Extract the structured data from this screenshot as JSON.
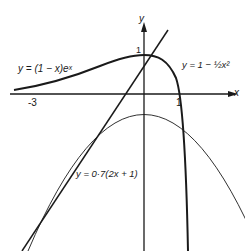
{
  "figure": {
    "axes": {
      "x_label": "x",
      "y_label": "y"
    },
    "ticks": {
      "x_neg3": "-3",
      "x_1": "1",
      "y_1": "1"
    },
    "curves": [
      {
        "name": "exp-curve",
        "label": "y = (1 − x)eˣ",
        "style": "thick"
      },
      {
        "name": "parabola",
        "label": "y = 1 − ½x²",
        "style": "thin"
      },
      {
        "name": "line",
        "label": "y = 0·7(2x + 1)",
        "style": "medium"
      }
    ]
  }
}
